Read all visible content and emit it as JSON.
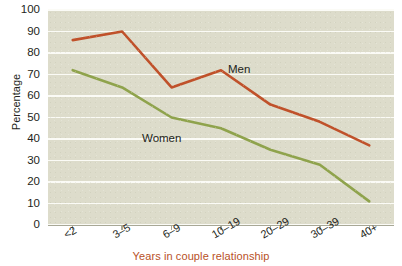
{
  "chart_data": {
    "type": "line",
    "title": "",
    "xlabel": "Years in couple relationship",
    "ylabel": "Percentage",
    "categories": [
      "<2",
      "3–5",
      "6–9",
      "10–19",
      "20–29",
      "30–39",
      "40+"
    ],
    "ylim": [
      0,
      100
    ],
    "yticks": [
      0,
      10,
      20,
      30,
      40,
      50,
      60,
      70,
      80,
      90,
      100
    ],
    "grid": true,
    "legend_position": "inline-annotation",
    "series": [
      {
        "name": "Men",
        "color": "#c0512a",
        "values": [
          86,
          90,
          64,
          72,
          56,
          48,
          37
        ]
      },
      {
        "name": "Women",
        "color": "#8fa34c",
        "values": [
          72,
          64,
          50,
          45,
          35,
          28,
          11
        ]
      }
    ],
    "annotations": [
      {
        "text": "Men",
        "series": "Men"
      },
      {
        "text": "Women",
        "series": "Women"
      }
    ]
  },
  "style": {
    "plot_background": "#dddccb",
    "gridline_color": "#fbfbf6",
    "axis_color": "#a8a896",
    "xlabel_color": "#b8511f",
    "text_color": "#231f20"
  }
}
